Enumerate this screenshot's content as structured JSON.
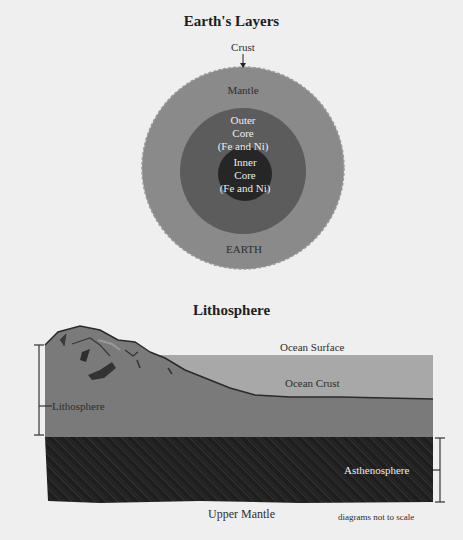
{
  "earth_layers": {
    "title": "Earth's Layers",
    "labels": {
      "crust": "Crust",
      "mantle": "Mantle",
      "outer_core": [
        "Outer",
        "Core",
        "(Fe and Ni)"
      ],
      "inner_core": [
        "Inner",
        "Core",
        "(Fe and Ni)"
      ],
      "earth": "EARTH"
    },
    "colors": {
      "mantle": "#8a8a8a",
      "outer_core": "#5c5c5c",
      "inner_core": "#262626"
    }
  },
  "lithosphere": {
    "title": "Lithosphere",
    "labels": {
      "ocean_surface": "Ocean Surface",
      "ocean_crust": "Ocean Crust",
      "lithosphere": "Lithosphere",
      "asthenosphere": "Asthenosphere",
      "upper_mantle": "Upper Mantle"
    },
    "colors": {
      "ocean": "#a8a8a8",
      "lithosphere": "#7a7a7a",
      "asthenosphere": "#1e1e1e"
    }
  },
  "footnote": "diagrams not to scale"
}
